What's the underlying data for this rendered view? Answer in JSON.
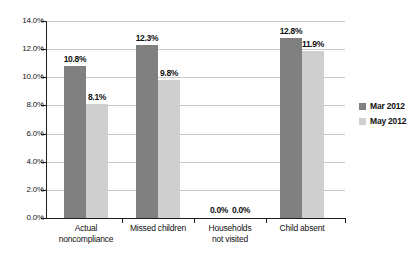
{
  "chart_data": {
    "type": "bar",
    "title": "",
    "xlabel": "",
    "ylabel": "",
    "ylim": [
      0,
      14
    ],
    "ytick_labels": [
      "0.0%",
      "2.0%",
      "4.0%",
      "6.0%",
      "8.0%",
      "10.0%",
      "12.0%",
      "14.0%"
    ],
    "ytick_values": [
      0,
      2,
      4,
      6,
      8,
      10,
      12,
      14
    ],
    "grid": true,
    "legend_position": "right",
    "categories": [
      "Actual\nnoncompliance",
      "Missed children",
      "Households\nnot visited",
      "Child absent"
    ],
    "series": [
      {
        "name": "Mar 2012",
        "color": "#808080",
        "values": [
          10.8,
          12.3,
          0.0,
          12.8
        ],
        "labels": [
          "10.8%",
          "12.3%",
          "0.0%",
          "12.8%"
        ]
      },
      {
        "name": "May 2012",
        "color": "#cfcfcf",
        "values": [
          8.1,
          9.8,
          0.0,
          11.9
        ],
        "labels": [
          "8.1%",
          "9.8%",
          "0.0%",
          "11.9%"
        ]
      }
    ]
  },
  "legend": {
    "items": [
      {
        "label": "Mar 2012",
        "color": "#808080"
      },
      {
        "label": "May 2012",
        "color": "#cfcfcf"
      }
    ]
  }
}
